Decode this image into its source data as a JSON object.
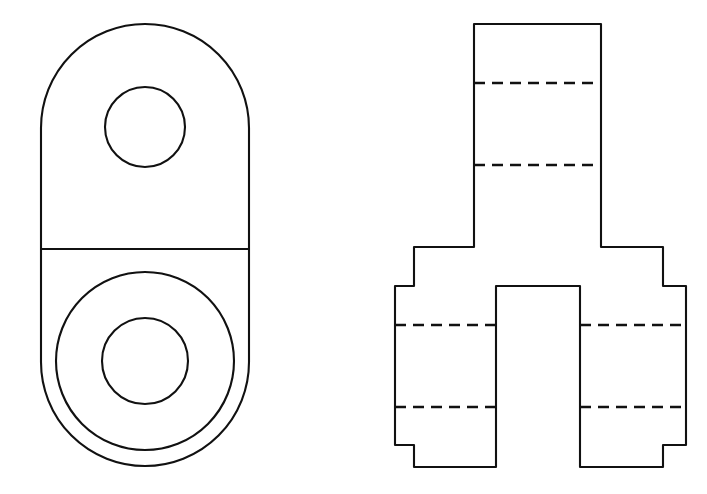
{
  "document": {
    "kind": "orthographic-engineering-drawing",
    "background_color": "#ffffff",
    "line_color": "#111111",
    "width": 707,
    "height": 494,
    "projection": "third-angle-style two-view layout",
    "visible_text": []
  },
  "views": {
    "left": {
      "name": "end-view",
      "description": "Obround (slot-shaped) plate outline with two bores and a horizontal parting line",
      "bounds": {
        "x": 41,
        "y": 24,
        "width": 208,
        "height": 442
      },
      "outline": {
        "left_x": 41,
        "right_x": 249,
        "top_y": 24,
        "bottom_y": 466,
        "top_corner_radius": 104,
        "bottom_corner_radius": 104
      },
      "parting_line": {
        "y": 249,
        "x1": 41,
        "x2": 249
      },
      "circles": [
        {
          "name": "upper-bore",
          "cx": 145,
          "cy": 127,
          "r": 40
        },
        {
          "name": "lower-counterbore",
          "cx": 145,
          "cy": 361,
          "r": 89
        },
        {
          "name": "lower-bore",
          "cx": 145,
          "cy": 361,
          "r": 43
        }
      ]
    },
    "right": {
      "name": "front-view",
      "description": "Stepped bracket profile: tall central column over a wide flanged body with a central bottom notch and two outboard bosses",
      "bounds": {
        "x": 395,
        "y": 24,
        "width": 291,
        "height": 443
      },
      "profile_points": [
        [
          474,
          24
        ],
        [
          601,
          24
        ],
        [
          601,
          247
        ],
        [
          663,
          247
        ],
        [
          663,
          286
        ],
        [
          686,
          286
        ],
        [
          686,
          445
        ],
        [
          663,
          445
        ],
        [
          663,
          467
        ],
        [
          580,
          467
        ],
        [
          580,
          286
        ],
        [
          496,
          286
        ],
        [
          496,
          467
        ],
        [
          414,
          467
        ],
        [
          414,
          445
        ],
        [
          395,
          445
        ],
        [
          395,
          286
        ],
        [
          414,
          286
        ],
        [
          414,
          247
        ],
        [
          474,
          247
        ]
      ],
      "hidden_lines": [
        {
          "name": "column-hidden-upper",
          "x1": 474,
          "y1": 83,
          "x2": 601,
          "y2": 83
        },
        {
          "name": "column-hidden-lower",
          "x1": 474,
          "y1": 165,
          "x2": 601,
          "y2": 165
        },
        {
          "name": "left-boss-hidden-upper",
          "x1": 395,
          "y1": 325,
          "x2": 496,
          "y2": 325
        },
        {
          "name": "right-boss-hidden-upper",
          "x1": 580,
          "y1": 325,
          "x2": 686,
          "y2": 325
        },
        {
          "name": "left-boss-hidden-lower",
          "x1": 395,
          "y1": 407,
          "x2": 496,
          "y2": 407
        },
        {
          "name": "right-boss-hidden-lower",
          "x1": 580,
          "y1": 407,
          "x2": 686,
          "y2": 407
        }
      ]
    }
  }
}
